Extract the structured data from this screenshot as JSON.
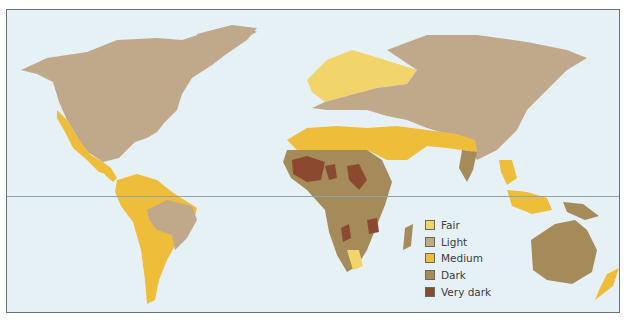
{
  "map": {
    "type": "world skin color distribution",
    "ocean_color": "#e6f1f6",
    "equator_line": true
  },
  "legend": {
    "items": [
      {
        "label": "Fair",
        "color": "#f1d46a"
      },
      {
        "label": "Light",
        "color": "#bfa98a"
      },
      {
        "label": "Medium",
        "color": "#eebe3a"
      },
      {
        "label": "Dark",
        "color": "#a58a5a"
      },
      {
        "label": "Very dark",
        "color": "#8b4a30"
      }
    ]
  }
}
